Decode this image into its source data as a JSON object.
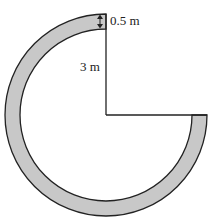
{
  "diagram": {
    "labels": {
      "width": "0.5 m",
      "radius": "3 m"
    },
    "colors": {
      "ring_fill": "#c8c8c8",
      "stroke": "#222222"
    }
  }
}
